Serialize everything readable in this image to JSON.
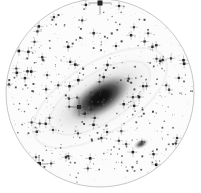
{
  "image": {
    "kind": "astronomical-photographic-plate",
    "title": "Andromeda Galaxy (M31) photographic plate",
    "rendering": "negative / inverted grayscale",
    "width": 201,
    "height": 193,
    "background_color": "#ffffff",
    "ink_color": "#202020"
  },
  "field": {
    "shape": "circle",
    "center_x": 100,
    "center_y": 93,
    "radius": 94,
    "outline_color": "#b9b9b9",
    "outline_width": 0.8,
    "interior_color": "#fdfdfd"
  },
  "objects": [
    {
      "name": "main-galaxy",
      "label": "M31",
      "type": "spiral-galaxy",
      "cx": 100,
      "cy": 98,
      "major_radius": 86,
      "minor_radius": 27,
      "angle_deg": -32,
      "core_radius": 16,
      "core_color": "#1a1a1a"
    },
    {
      "name": "companion-galaxy-lower-right",
      "label": "M32",
      "type": "elliptical-galaxy",
      "cx": 141,
      "cy": 144,
      "major_radius": 9,
      "minor_radius": 5,
      "angle_deg": -25,
      "core_color": "#3a3a3a"
    },
    {
      "name": "bright-star-top",
      "type": "star",
      "cx": 100,
      "cy": 3,
      "size": 5
    },
    {
      "name": "bright-star-mid-left",
      "type": "star",
      "cx": 79,
      "cy": 107,
      "size": 4
    },
    {
      "name": "bright-star-lower-left",
      "type": "star",
      "cx": 39,
      "cy": 164,
      "size": 4
    }
  ],
  "starfield": {
    "count": 620,
    "min_size": 0.7,
    "max_size": 2.6,
    "seed": 20240917,
    "color_light": "#cfcfcf",
    "color_dark": "#1e1e1e"
  },
  "chart_data": {
    "type": "scatter",
    "xlabel": "",
    "ylabel": "",
    "xlim": [
      0,
      201
    ],
    "ylim": [
      0,
      193
    ],
    "grid": false,
    "legend": "none",
    "series": [
      {
        "name": "galaxy-core",
        "x": [
          100
        ],
        "y": [
          98
        ],
        "values": [
          100
        ]
      },
      {
        "name": "companion-galaxy",
        "x": [
          141
        ],
        "y": [
          144
        ],
        "values": [
          45
        ]
      },
      {
        "name": "bright-stars",
        "x": [
          100,
          79,
          39,
          104,
          12,
          120,
          176,
          61,
          150,
          34
        ],
        "y": [
          3,
          107,
          164,
          14,
          97,
          58,
          75,
          39,
          171,
          46
        ],
        "values": [
          95,
          80,
          70,
          60,
          58,
          55,
          52,
          50,
          48,
          45
        ]
      }
    ]
  }
}
